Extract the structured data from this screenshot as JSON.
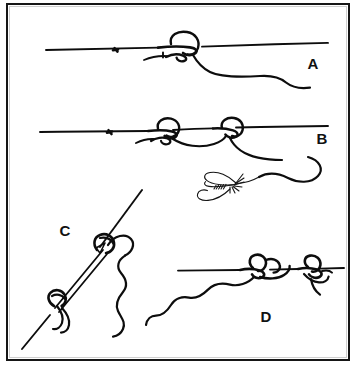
{
  "figure": {
    "kind": "line-drawing-illustration",
    "background_color": "#ffffff",
    "ink_color": "#0d0d0d",
    "border_color": "#161616",
    "width": 357,
    "height": 371
  },
  "panels": [
    {
      "id": "A",
      "label": "A",
      "label_x": 305,
      "label_y": 64,
      "description": "horizontal line with a single loop knot tied near the middle and a tag end curving down to the right"
    },
    {
      "id": "B",
      "label": "B",
      "label_x": 314,
      "label_y": 139,
      "description": "horizontal line with two loop knots joined, tag end curving down to an artificial fly"
    },
    {
      "id": "C",
      "label": "C",
      "label_x": 57,
      "label_y": 231,
      "description": "diagonal doubled line with knots at both ends and a wavy tag end"
    },
    {
      "id": "D",
      "label": "D",
      "label_x": 258,
      "label_y": 317,
      "description": "horizontal line with two knots and a long wavy tag end trailing to the lower left"
    }
  ],
  "elements": {
    "fly": {
      "name": "artificial-fly",
      "present": true
    },
    "caption": {
      "visible": false,
      "clipped_text": ""
    }
  }
}
